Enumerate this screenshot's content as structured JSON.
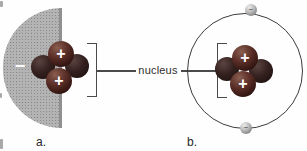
{
  "figure": {
    "nucleus_label": "nucleus",
    "panel_a": {
      "label": "a.",
      "electron_cloud_charge_symbol": "−",
      "protons": [
        {
          "symbol": "+"
        },
        {
          "symbol": "+"
        }
      ]
    },
    "panel_b": {
      "label": "b.",
      "protons": [
        {
          "symbol": "+"
        },
        {
          "symbol": "+"
        }
      ],
      "electrons": [
        {
          "symbol": "−"
        },
        {
          "symbol": "−"
        }
      ]
    }
  },
  "colors": {
    "background": "#fefefe",
    "electron_cloud_gray": "#b4b4b4",
    "cloud_edge_gray": "#8f8f8f",
    "proton_sphere_maroon": "#5e312a",
    "neutron_sphere_dark": "#352220",
    "electron_sphere_gray": "#bdbdbd",
    "line_and_bracket": "#4a4a4a",
    "text": "#2e2e2e"
  }
}
